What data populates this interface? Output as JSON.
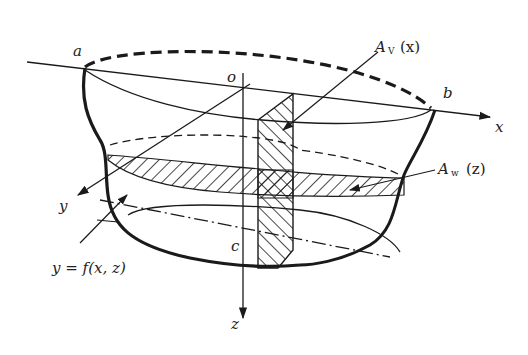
{
  "diagram": {
    "type": "ship-hull-geometry",
    "points": {
      "a": "a",
      "b": "b",
      "o": "o",
      "c": "c"
    },
    "axes": {
      "x": "x",
      "y": "y",
      "z": "z"
    },
    "labels": {
      "vertical_section": {
        "main": "A",
        "sub": "V",
        "arg": "(x)"
      },
      "waterplane_section": {
        "main": "A",
        "sub": "w",
        "arg": "(z)"
      },
      "surface_equation": "y = f(x, z)"
    },
    "colors": {
      "ink": "#1a1a1a",
      "background": "#ffffff"
    }
  }
}
